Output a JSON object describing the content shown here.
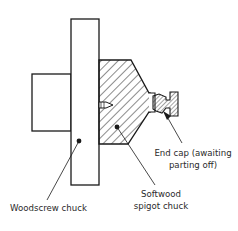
{
  "diagram": {
    "type": "technical cross-section",
    "labels": {
      "woodscrew_chuck": "Woodscrew chuck",
      "spigot_line1": "Softwood",
      "spigot_line2": "spigot chuck",
      "endcap_line1": "End cap (awaiting",
      "endcap_line2": "parting off)"
    },
    "colors": {
      "stroke": "#1a1a1a",
      "hatch": "#1a1a1a",
      "background": "#ffffff",
      "text": "#2a2a2a"
    }
  }
}
